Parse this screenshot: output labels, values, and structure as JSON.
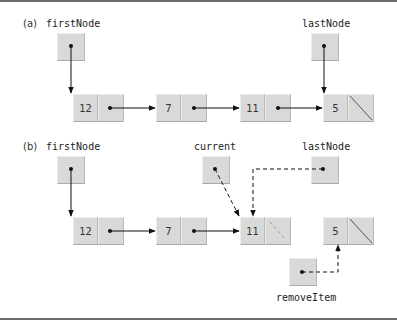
{
  "diagram": {
    "part_a": {
      "label": "(a)",
      "first_node_label": "firstNode",
      "last_node_label": "lastNode",
      "nodes": [
        {
          "value": "12",
          "link": "next"
        },
        {
          "value": "7",
          "link": "next"
        },
        {
          "value": "11",
          "link": "next"
        },
        {
          "value": "5",
          "link": "null"
        }
      ]
    },
    "part_b": {
      "label": "(b)",
      "first_node_label": "firstNode",
      "current_label": "current",
      "last_node_label": "lastNode",
      "remove_item_label": "removeItem",
      "nodes": [
        {
          "value": "12",
          "link": "next"
        },
        {
          "value": "7",
          "link": "next"
        },
        {
          "value": "11",
          "link": "null (new)"
        },
        {
          "value": "5",
          "link": "null"
        }
      ]
    },
    "colors": {
      "node_fill": "#d9d9d9",
      "arrow": "#111111",
      "rule": "#6e6e6e"
    }
  }
}
